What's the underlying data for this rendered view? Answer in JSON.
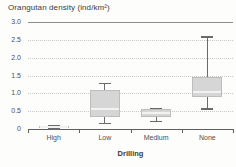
{
  "chart_data": {
    "type": "boxplot",
    "title": "Orangutan density (ind/km²)",
    "xlabel": "Drilling",
    "ylabel": "",
    "ylim": [
      0,
      3
    ],
    "yticks": [
      0,
      0.5,
      1,
      1.5,
      2,
      2.5,
      3
    ],
    "ytick_labels": [
      "0",
      "0.5",
      "1.0",
      "1.5",
      "2.0",
      "2.5",
      "3.0"
    ],
    "categories": [
      "High",
      "Low",
      "Medium",
      "None"
    ],
    "series": [
      {
        "category": "High",
        "whisker_low": 0.0,
        "q1": 0.02,
        "median": 0.05,
        "q3": 0.08,
        "whisker_high": 0.1
      },
      {
        "category": "Low",
        "whisker_low": 0.15,
        "q1": 0.35,
        "median": 0.55,
        "q3": 1.1,
        "whisker_high": 1.3
      },
      {
        "category": "Medium",
        "whisker_low": 0.2,
        "q1": 0.35,
        "median": 0.45,
        "q3": 0.55,
        "whisker_high": 0.6
      },
      {
        "category": "None",
        "whisker_low": 0.55,
        "q1": 0.9,
        "median": 1.05,
        "q3": 1.45,
        "whisker_high": 2.6
      }
    ],
    "legend": "none",
    "grid": "dotted horizontal lines at 0.5 intervals, solid line at 3.0, no left spine",
    "colors": {
      "box_fill": "#d6d6d6",
      "box_border": "#bdbdbd",
      "median": "#f2f2f1",
      "whisker": "#6b6b6b",
      "grid_dotted": "#c9c9c9",
      "grid_top": "#8f8f8f",
      "axis": "#5f5f5f",
      "tick_label": "#4f4f4f",
      "title_text": "#3a3a3a"
    }
  }
}
